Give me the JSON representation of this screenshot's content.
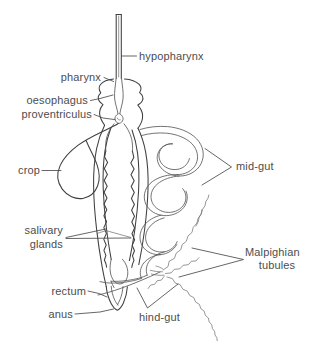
{
  "figure": {
    "background_color": "#ffffff",
    "line_color": "#3f3f3f",
    "text_color": "#4d4d4d",
    "width": 318,
    "height": 341
  },
  "labels": {
    "hypopharynx": "hypopharynx",
    "pharynx": "pharynx",
    "oesophagus": "oesophagus",
    "proventriculus": "proventriculus",
    "crop": "crop",
    "salivary_line1": "salivary",
    "salivary_line2": "glands",
    "rectum": "rectum",
    "anus": "anus",
    "hind_gut": "hind-gut",
    "mid_gut": "mid-gut",
    "malpighian_line1": "Malpighian",
    "malpighian_line2": "tubules"
  },
  "parts": [
    {
      "name": "hypopharynx",
      "label": "hypopharynx",
      "side": "right"
    },
    {
      "name": "pharynx",
      "label": "pharynx",
      "side": "left"
    },
    {
      "name": "oesophagus",
      "label": "oesophagus",
      "side": "left"
    },
    {
      "name": "proventriculus",
      "label": "proventriculus",
      "side": "left"
    },
    {
      "name": "crop",
      "label": "crop",
      "side": "left"
    },
    {
      "name": "salivary-glands",
      "label": "salivary glands",
      "side": "left"
    },
    {
      "name": "rectum",
      "label": "rectum",
      "side": "left"
    },
    {
      "name": "anus",
      "label": "anus",
      "side": "left"
    },
    {
      "name": "hind-gut",
      "label": "hind-gut",
      "side": "bottom"
    },
    {
      "name": "mid-gut",
      "label": "mid-gut",
      "side": "right"
    },
    {
      "name": "malpighian-tubules",
      "label": "Malpighian tubules",
      "side": "right"
    }
  ]
}
